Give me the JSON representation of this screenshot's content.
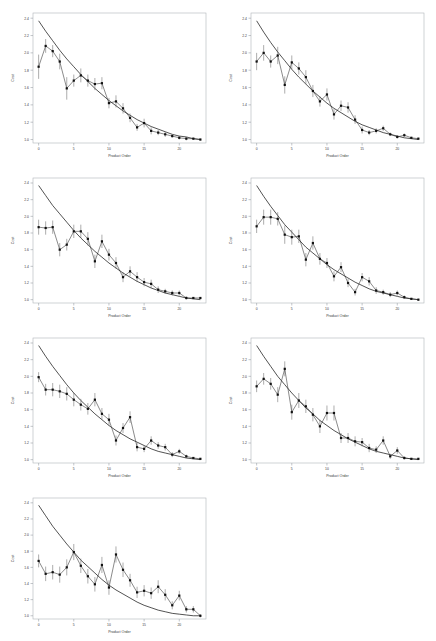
{
  "figure": {
    "panel_count": 7,
    "grid_columns": 2,
    "grid_rows": 4,
    "background_color": "#ffffff"
  },
  "axes": {
    "xlabel": "Product Order",
    "ylabel": "Cost",
    "x_ticks": [
      "0",
      "5",
      "10",
      "15",
      "20"
    ],
    "x_tick_values": [
      0,
      5,
      10,
      15,
      20
    ],
    "y_ticks": [
      "1.0",
      "1.2",
      "1.4",
      "1.6",
      "1.8",
      "2.0",
      "2.2",
      "2.4"
    ],
    "y_tick_values": [
      1.0,
      1.2,
      1.4,
      1.6,
      1.8,
      2.0,
      2.2,
      2.4
    ],
    "xlim": [
      -0.8,
      23.8
    ],
    "ylim": [
      0.96,
      2.46
    ],
    "grid": false,
    "legend": null
  },
  "style": {
    "marker_color": "#111111",
    "line_color": "#2a2a2a",
    "fit_color": "#1a1a1a",
    "error_color": "#5a5a5a",
    "frame_color": "#b0b4b8"
  },
  "chart_data": [
    {
      "type": "line",
      "title": "",
      "xlabel": "Product Order",
      "ylabel": "Cost",
      "xlim": [
        -0.8,
        23.8
      ],
      "ylim": [
        0.96,
        2.46
      ],
      "grid": false,
      "x": [
        0,
        1,
        2,
        3,
        4,
        5,
        6,
        7,
        8,
        9,
        10,
        11,
        12,
        13,
        14,
        15,
        16,
        17,
        18,
        19,
        20,
        21,
        22,
        23
      ],
      "series": [
        {
          "name": "Observed Cost",
          "values": [
            1.84,
            2.08,
            2.02,
            1.9,
            1.59,
            1.68,
            1.74,
            1.68,
            1.64,
            1.65,
            1.42,
            1.44,
            1.36,
            1.25,
            1.14,
            1.19,
            1.1,
            1.08,
            1.06,
            1.04,
            1.02,
            1.01,
            1.01,
            1.0
          ],
          "errors": [
            0.14,
            0.08,
            0.07,
            0.09,
            0.13,
            0.07,
            0.08,
            0.07,
            0.07,
            0.07,
            0.06,
            0.07,
            0.06,
            0.05,
            0.04,
            0.05,
            0.04,
            0.03,
            0.03,
            0.02,
            0.02,
            0.02,
            0.01,
            0.01
          ]
        },
        {
          "name": "Fitted Learning Curve",
          "values": [
            2.37,
            2.25,
            2.14,
            2.03,
            1.93,
            1.84,
            1.75,
            1.67,
            1.59,
            1.52,
            1.45,
            1.39,
            1.33,
            1.28,
            1.23,
            1.19,
            1.15,
            1.12,
            1.09,
            1.06,
            1.04,
            1.03,
            1.01,
            1.0
          ]
        }
      ]
    },
    {
      "type": "line",
      "title": "",
      "xlabel": "Product Order",
      "ylabel": "Cost",
      "xlim": [
        -0.8,
        23.8
      ],
      "ylim": [
        0.96,
        2.46
      ],
      "grid": false,
      "x": [
        0,
        1,
        2,
        3,
        4,
        5,
        6,
        7,
        8,
        9,
        10,
        11,
        12,
        13,
        14,
        15,
        16,
        17,
        18,
        19,
        20,
        21,
        22,
        23
      ],
      "series": [
        {
          "name": "Observed Cost",
          "values": [
            1.9,
            2.0,
            1.9,
            1.97,
            1.63,
            1.89,
            1.82,
            1.72,
            1.56,
            1.44,
            1.52,
            1.29,
            1.39,
            1.37,
            1.23,
            1.11,
            1.08,
            1.1,
            1.13,
            1.06,
            1.03,
            1.05,
            1.02,
            1.01
          ],
          "errors": [
            0.1,
            0.09,
            0.07,
            0.1,
            0.1,
            0.08,
            0.07,
            0.08,
            0.07,
            0.06,
            0.07,
            0.06,
            0.06,
            0.06,
            0.05,
            0.04,
            0.03,
            0.03,
            0.03,
            0.02,
            0.02,
            0.02,
            0.01,
            0.01
          ]
        },
        {
          "name": "Fitted Learning Curve",
          "values": [
            2.37,
            2.24,
            2.12,
            2.01,
            1.91,
            1.81,
            1.72,
            1.64,
            1.56,
            1.49,
            1.42,
            1.36,
            1.31,
            1.26,
            1.21,
            1.17,
            1.14,
            1.11,
            1.08,
            1.06,
            1.04,
            1.02,
            1.01,
            1.0
          ]
        }
      ]
    },
    {
      "type": "line",
      "title": "",
      "xlabel": "Product Order",
      "ylabel": "Cost",
      "xlim": [
        -0.8,
        23.8
      ],
      "ylim": [
        0.96,
        2.46
      ],
      "grid": false,
      "x": [
        0,
        1,
        2,
        3,
        4,
        5,
        6,
        7,
        8,
        9,
        10,
        11,
        12,
        13,
        14,
        15,
        16,
        17,
        18,
        19,
        20,
        21,
        22,
        23
      ],
      "series": [
        {
          "name": "Observed Cost",
          "values": [
            1.87,
            1.86,
            1.87,
            1.6,
            1.66,
            1.82,
            1.82,
            1.73,
            1.46,
            1.7,
            1.54,
            1.44,
            1.27,
            1.34,
            1.27,
            1.21,
            1.19,
            1.12,
            1.1,
            1.08,
            1.08,
            1.02,
            1.02,
            1.02
          ],
          "errors": [
            0.09,
            0.08,
            0.08,
            0.08,
            0.07,
            0.08,
            0.08,
            0.08,
            0.08,
            0.08,
            0.07,
            0.07,
            0.06,
            0.06,
            0.06,
            0.05,
            0.05,
            0.04,
            0.03,
            0.03,
            0.03,
            0.02,
            0.01,
            0.01
          ]
        },
        {
          "name": "Fitted Learning Curve",
          "values": [
            2.37,
            2.25,
            2.13,
            2.03,
            1.93,
            1.83,
            1.74,
            1.66,
            1.58,
            1.51,
            1.44,
            1.38,
            1.32,
            1.27,
            1.22,
            1.18,
            1.14,
            1.11,
            1.08,
            1.06,
            1.04,
            1.02,
            1.01,
            1.0
          ]
        }
      ]
    },
    {
      "type": "line",
      "title": "",
      "xlabel": "Product Order",
      "ylabel": "Cost",
      "xlim": [
        -0.8,
        23.8
      ],
      "ylim": [
        0.96,
        2.46
      ],
      "grid": false,
      "x": [
        0,
        1,
        2,
        3,
        4,
        5,
        6,
        7,
        8,
        9,
        10,
        11,
        12,
        13,
        14,
        15,
        16,
        17,
        18,
        19,
        20,
        21,
        22,
        23
      ],
      "series": [
        {
          "name": "Observed Cost",
          "values": [
            1.88,
            1.99,
            1.99,
            1.97,
            1.78,
            1.75,
            1.76,
            1.48,
            1.68,
            1.49,
            1.44,
            1.28,
            1.39,
            1.2,
            1.09,
            1.27,
            1.22,
            1.11,
            1.09,
            1.06,
            1.08,
            1.03,
            1.01,
            1.0
          ],
          "errors": [
            0.08,
            0.09,
            0.09,
            0.08,
            0.11,
            0.09,
            0.08,
            0.08,
            0.08,
            0.07,
            0.06,
            0.06,
            0.06,
            0.05,
            0.04,
            0.05,
            0.05,
            0.04,
            0.03,
            0.03,
            0.03,
            0.02,
            0.01,
            0.01
          ]
        },
        {
          "name": "Fitted Learning Curve",
          "values": [
            2.37,
            2.24,
            2.12,
            2.01,
            1.9,
            1.81,
            1.72,
            1.63,
            1.56,
            1.49,
            1.42,
            1.36,
            1.31,
            1.26,
            1.21,
            1.17,
            1.13,
            1.1,
            1.08,
            1.06,
            1.04,
            1.02,
            1.01,
            1.0
          ]
        }
      ]
    },
    {
      "type": "line",
      "title": "",
      "xlabel": "Product Order",
      "ylabel": "Cost",
      "xlim": [
        -0.8,
        23.8
      ],
      "ylim": [
        0.96,
        2.46
      ],
      "grid": false,
      "x": [
        0,
        1,
        2,
        3,
        4,
        5,
        6,
        7,
        8,
        9,
        10,
        11,
        12,
        13,
        14,
        15,
        16,
        17,
        18,
        19,
        20,
        21,
        22,
        23
      ],
      "series": [
        {
          "name": "Observed Cost",
          "values": [
            1.99,
            1.84,
            1.84,
            1.82,
            1.79,
            1.72,
            1.66,
            1.61,
            1.72,
            1.55,
            1.48,
            1.23,
            1.38,
            1.51,
            1.15,
            1.13,
            1.23,
            1.17,
            1.15,
            1.06,
            1.1,
            1.04,
            1.02,
            1.01
          ],
          "errors": [
            0.06,
            0.07,
            0.08,
            0.08,
            0.08,
            0.08,
            0.07,
            0.07,
            0.08,
            0.07,
            0.07,
            0.06,
            0.06,
            0.07,
            0.05,
            0.04,
            0.05,
            0.04,
            0.04,
            0.03,
            0.03,
            0.02,
            0.01,
            0.01
          ]
        },
        {
          "name": "Fitted Learning Curve",
          "values": [
            2.37,
            2.24,
            2.12,
            2.01,
            1.9,
            1.8,
            1.71,
            1.63,
            1.55,
            1.48,
            1.41,
            1.35,
            1.3,
            1.25,
            1.21,
            1.17,
            1.13,
            1.1,
            1.08,
            1.06,
            1.04,
            1.02,
            1.01,
            1.0
          ]
        }
      ]
    },
    {
      "type": "line",
      "title": "",
      "xlabel": "Product Order",
      "ylabel": "Cost",
      "xlim": [
        -0.8,
        23.8
      ],
      "ylim": [
        0.96,
        2.46
      ],
      "grid": false,
      "x": [
        0,
        1,
        2,
        3,
        4,
        5,
        6,
        7,
        8,
        9,
        10,
        11,
        12,
        13,
        14,
        15,
        16,
        17,
        18,
        19,
        20,
        21,
        22,
        23
      ],
      "series": [
        {
          "name": "Observed Cost",
          "values": [
            1.88,
            1.97,
            1.91,
            1.78,
            2.09,
            1.57,
            1.71,
            1.64,
            1.54,
            1.4,
            1.56,
            1.56,
            1.26,
            1.26,
            1.22,
            1.21,
            1.14,
            1.12,
            1.23,
            1.04,
            1.11,
            1.02,
            1.01,
            1.01
          ],
          "errors": [
            0.07,
            0.07,
            0.07,
            0.09,
            0.09,
            0.09,
            0.09,
            0.08,
            0.08,
            0.08,
            0.09,
            0.09,
            0.06,
            0.06,
            0.06,
            0.05,
            0.05,
            0.04,
            0.05,
            0.03,
            0.04,
            0.02,
            0.01,
            0.01
          ]
        },
        {
          "name": "Fitted Learning Curve",
          "values": [
            2.37,
            2.24,
            2.12,
            2.0,
            1.9,
            1.8,
            1.71,
            1.62,
            1.55,
            1.47,
            1.41,
            1.35,
            1.3,
            1.25,
            1.21,
            1.17,
            1.13,
            1.1,
            1.08,
            1.06,
            1.04,
            1.02,
            1.01,
            1.0
          ]
        }
      ]
    },
    {
      "type": "line",
      "title": "",
      "xlabel": "Product Order",
      "ylabel": "Cost",
      "xlim": [
        -0.8,
        23.8
      ],
      "ylim": [
        0.96,
        2.46
      ],
      "grid": false,
      "x": [
        0,
        1,
        2,
        3,
        4,
        5,
        6,
        7,
        8,
        9,
        10,
        11,
        12,
        13,
        14,
        15,
        16,
        17,
        18,
        19,
        20,
        21,
        22,
        23
      ],
      "series": [
        {
          "name": "Observed Cost",
          "values": [
            1.68,
            1.52,
            1.54,
            1.51,
            1.6,
            1.79,
            1.62,
            1.49,
            1.39,
            1.63,
            1.35,
            1.76,
            1.57,
            1.44,
            1.29,
            1.31,
            1.28,
            1.36,
            1.26,
            1.13,
            1.25,
            1.08,
            1.08,
            1.0
          ],
          "errors": [
            0.08,
            0.09,
            0.09,
            0.1,
            0.1,
            0.1,
            0.09,
            0.09,
            0.09,
            0.1,
            0.09,
            0.1,
            0.09,
            0.08,
            0.07,
            0.07,
            0.07,
            0.08,
            0.07,
            0.05,
            0.06,
            0.04,
            0.04,
            0.02
          ]
        },
        {
          "name": "Fitted Learning Curve",
          "values": [
            2.37,
            2.24,
            2.11,
            2.0,
            1.89,
            1.79,
            1.69,
            1.61,
            1.53,
            1.45,
            1.38,
            1.32,
            1.27,
            1.22,
            1.17,
            1.13,
            1.1,
            1.07,
            1.05,
            1.03,
            1.02,
            1.01,
            1.0,
            1.0
          ]
        }
      ]
    }
  ]
}
